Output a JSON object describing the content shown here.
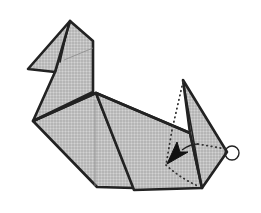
{
  "diagram": {
    "type": "origami-folding-step",
    "colors": {
      "paper_fill": "#bdbdbd",
      "line": "#222222",
      "background": "#ffffff"
    },
    "elements": [
      {
        "name": "head-and-neck",
        "kind": "paper-flap"
      },
      {
        "name": "body",
        "kind": "paper-flap"
      },
      {
        "name": "tail-flap",
        "kind": "paper-flap"
      },
      {
        "name": "valley-fold-line",
        "kind": "dotted-line"
      },
      {
        "name": "fold-direction-arrow",
        "kind": "arrow"
      },
      {
        "name": "pivot-point-circle",
        "kind": "circle-marker"
      }
    ]
  }
}
